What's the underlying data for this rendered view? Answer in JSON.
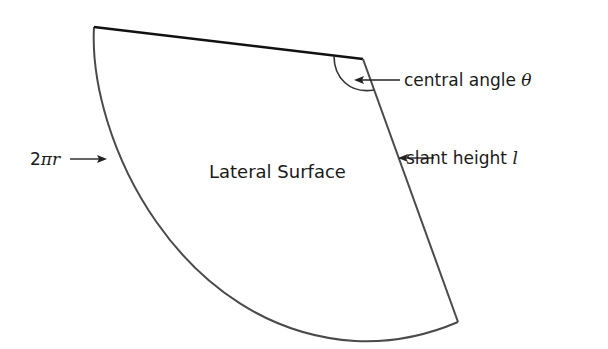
{
  "diagram": {
    "region_label": "Lateral Surface",
    "labels": {
      "central_angle": {
        "text": "central angle ",
        "symbol": "θ"
      },
      "slant_height": {
        "text": "slant height ",
        "symbol": "l"
      },
      "arc_length": {
        "prefix": "2",
        "pi": "π",
        "var": "r"
      }
    },
    "colors": {
      "stroke": "#4a4a4a",
      "top_edge": "#111111",
      "text": "#1a1a1a",
      "background": "#ffffff"
    }
  }
}
